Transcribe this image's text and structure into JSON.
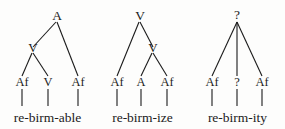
{
  "figure": {
    "background_color": "#fdfdfc",
    "ink_color": "#1b1b1b"
  },
  "trees": [
    {
      "id": "tree-able",
      "root": "A",
      "internal": "V",
      "leaves": [
        "Af",
        "V",
        "Af"
      ],
      "word": "re-birm-able"
    },
    {
      "id": "tree-ize",
      "root": "V",
      "internal": "V",
      "leaves": [
        "Af",
        "A",
        "Af"
      ],
      "word": "re-birm-ize"
    },
    {
      "id": "tree-ity",
      "root": "?",
      "internal": "?",
      "leaves": [
        "Af",
        "?",
        "Af"
      ],
      "word": "re-birm-ity"
    }
  ]
}
